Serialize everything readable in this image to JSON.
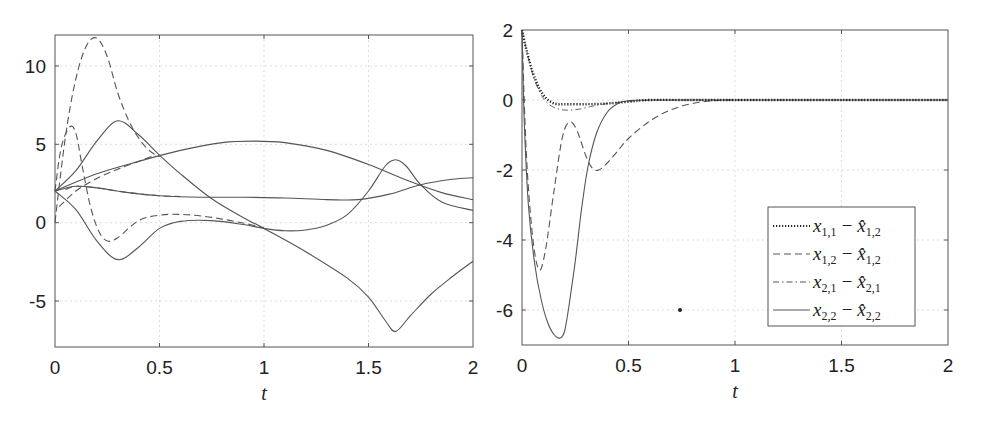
{
  "chart_data": [
    {
      "type": "line",
      "title": "",
      "xlabel": "t",
      "ylabel": "",
      "xlim": [
        0,
        2
      ],
      "ylim": [
        -8,
        12
      ],
      "xticks": [
        "0",
        "0.5",
        "1",
        "1.5",
        "2"
      ],
      "yticks": [
        "-5",
        "0",
        "5",
        "10"
      ],
      "grid": true,
      "legend": null,
      "series": [
        {
          "name": "dashed-large-peak",
          "style": "dashed",
          "x": [
            0,
            0.05,
            0.1,
            0.15,
            0.2,
            0.25,
            0.3,
            0.35,
            0.4,
            0.45,
            0.5
          ],
          "y": [
            0,
            5.5,
            9.2,
            11.3,
            11.8,
            10.6,
            8.3,
            6.6,
            5.4,
            4.6,
            4.2
          ]
        },
        {
          "name": "dashed-small-peak",
          "style": "dashed",
          "x": [
            0,
            0.03,
            0.07,
            0.1,
            0.13,
            0.17,
            0.21,
            0.25,
            0.3,
            0.4,
            0.5,
            0.6,
            0.7,
            0.8,
            0.9,
            1.0
          ],
          "y": [
            2,
            4.8,
            6.1,
            5.7,
            3.6,
            1.0,
            -0.6,
            -1.2,
            -1.0,
            0.1,
            0.45,
            0.5,
            0.4,
            0.2,
            -0.05,
            -0.35
          ]
        },
        {
          "name": "solid-peak-then-descent",
          "style": "solid",
          "x": [
            0,
            0.1,
            0.2,
            0.3,
            0.4,
            0.5,
            0.6,
            0.75,
            0.9,
            1.0,
            1.2,
            1.4,
            1.5,
            1.58,
            1.63,
            1.7,
            1.8,
            1.9,
            2.0
          ],
          "y": [
            2,
            3.3,
            5.2,
            6.5,
            5.6,
            4.3,
            3.1,
            1.5,
            0.3,
            -0.4,
            -1.9,
            -3.6,
            -4.8,
            -6.3,
            -7.0,
            -6.0,
            -4.6,
            -3.5,
            -2.5
          ]
        },
        {
          "name": "solid-arch",
          "style": "solid",
          "x": [
            0,
            0.2,
            0.4,
            0.6,
            0.8,
            0.95,
            1.1,
            1.3,
            1.5,
            1.7,
            1.85,
            2.0
          ],
          "y": [
            2,
            3.1,
            3.9,
            4.6,
            5.1,
            5.2,
            5.1,
            4.6,
            3.7,
            2.6,
            1.9,
            1.45
          ]
        },
        {
          "name": "dashed-along-arch",
          "style": "dashed",
          "x": [
            0.02,
            0.1,
            0.2,
            0.3,
            0.4,
            0.48
          ],
          "y": [
            1.0,
            2.0,
            2.8,
            3.4,
            3.9,
            4.3
          ]
        },
        {
          "name": "solid-flat-then-rise",
          "style": "solid",
          "x": [
            0,
            0.1,
            0.2,
            0.35,
            0.5,
            0.7,
            0.9,
            1.1,
            1.3,
            1.45,
            1.6,
            1.75,
            1.9,
            2.0
          ],
          "y": [
            2,
            2.3,
            2.2,
            1.9,
            1.7,
            1.6,
            1.6,
            1.55,
            1.45,
            1.45,
            1.8,
            2.4,
            2.75,
            2.85
          ]
        },
        {
          "name": "dashed-flat",
          "style": "dashed",
          "x": [
            0.05,
            0.1,
            0.2,
            0.35,
            0.5,
            0.6
          ],
          "y": [
            2.1,
            2.3,
            2.2,
            1.9,
            1.7,
            1.65
          ]
        },
        {
          "name": "solid-dip-then-bump",
          "style": "solid",
          "x": [
            0,
            0.1,
            0.2,
            0.3,
            0.4,
            0.5,
            0.6,
            0.75,
            0.9,
            1.0,
            1.1,
            1.2,
            1.3,
            1.4,
            1.5,
            1.58,
            1.63,
            1.68,
            1.75,
            1.85,
            2.0
          ],
          "y": [
            2,
            0.8,
            -1.2,
            -2.4,
            -1.6,
            -0.4,
            0.05,
            0.1,
            -0.15,
            -0.4,
            -0.55,
            -0.5,
            -0.2,
            0.5,
            2.0,
            3.6,
            4.0,
            3.6,
            2.4,
            1.3,
            0.75
          ]
        }
      ]
    },
    {
      "type": "line",
      "title": "",
      "xlabel": "t",
      "ylabel": "",
      "xlim": [
        0,
        2
      ],
      "ylim": [
        -7,
        2
      ],
      "xticks": [
        "0",
        "0.5",
        "1",
        "1.5",
        "2"
      ],
      "yticks": [
        "2",
        "0",
        "-2",
        "-4",
        "-6"
      ],
      "grid": true,
      "legend": {
        "position": "lower right"
      },
      "annotations": [
        {
          "type": "point",
          "x": 0.74,
          "y": -6
        }
      ],
      "series": [
        {
          "name": "x_{1,1} - x̂_{1,2}",
          "style": "dotted",
          "x": [
            0,
            0.02,
            0.05,
            0.08,
            0.11,
            0.14,
            0.17,
            0.2,
            0.3,
            0.4,
            0.5,
            0.6,
            0.8,
            1.0,
            1.5,
            2.0
          ],
          "y": [
            2,
            1.45,
            0.8,
            0.35,
            0.07,
            -0.07,
            -0.12,
            -0.12,
            -0.12,
            -0.1,
            -0.05,
            0.0,
            0.0,
            0.0,
            0.0,
            0.0
          ]
        },
        {
          "name": "x_{1,2} - x̂_{1,2}",
          "style": "dashed",
          "x": [
            0,
            0.02,
            0.05,
            0.08,
            0.11,
            0.15,
            0.19,
            0.225,
            0.26,
            0.3,
            0.33,
            0.36,
            0.4,
            0.45,
            0.5,
            0.6,
            0.7,
            0.8,
            0.9,
            1.0
          ],
          "y": [
            2,
            -1.5,
            -3.9,
            -4.85,
            -4.3,
            -2.6,
            -1.05,
            -0.63,
            -0.9,
            -1.6,
            -1.95,
            -2.0,
            -1.8,
            -1.45,
            -1.1,
            -0.6,
            -0.28,
            -0.1,
            -0.02,
            0.0
          ]
        },
        {
          "name": "x_{2,1} - x̂_{2,1}",
          "style": "dashdot",
          "x": [
            0,
            0.03,
            0.06,
            0.1,
            0.14,
            0.18,
            0.22,
            0.27,
            0.32,
            0.38,
            0.45,
            0.55,
            0.7,
            1.0,
            2.0
          ],
          "y": [
            2,
            1.2,
            0.55,
            0.05,
            -0.18,
            -0.27,
            -0.29,
            -0.26,
            -0.19,
            -0.12,
            -0.07,
            -0.02,
            0.0,
            0.0,
            0.0
          ]
        },
        {
          "name": "x_{2,2} - x̂_{2,2}",
          "style": "solid",
          "x": [
            0,
            0.01,
            0.03,
            0.06,
            0.09,
            0.12,
            0.15,
            0.18,
            0.2,
            0.22,
            0.25,
            0.28,
            0.31,
            0.35,
            0.4,
            0.45,
            0.5,
            0.6,
            1.0,
            2.0
          ],
          "y": [
            2,
            -0.5,
            -3.0,
            -4.7,
            -5.7,
            -6.35,
            -6.7,
            -6.8,
            -6.6,
            -5.9,
            -4.6,
            -3.1,
            -1.9,
            -0.95,
            -0.35,
            -0.1,
            -0.02,
            0.0,
            0.0,
            0.0
          ]
        }
      ]
    }
  ],
  "left_plot": {
    "xticks": [
      "0",
      "0.5",
      "1",
      "1.5",
      "2"
    ],
    "yticks": [
      "10",
      "5",
      "0",
      "-5"
    ],
    "xlabel": "t"
  },
  "right_plot": {
    "xticks": [
      "0",
      "0.5",
      "1",
      "1.5",
      "2"
    ],
    "yticks": [
      "2",
      "0",
      "-2",
      "-4",
      "-6"
    ],
    "xlabel": "t",
    "legend": [
      {
        "a": "x",
        "a_sub": "1,1",
        "op": "−",
        "b": "x̂",
        "b_sub": "1,2"
      },
      {
        "a": "x",
        "a_sub": "1,2",
        "op": "−",
        "b": "x̂",
        "b_sub": "1,2"
      },
      {
        "a": "x",
        "a_sub": "2,1",
        "op": "−",
        "b": "x̂",
        "b_sub": "2,1"
      },
      {
        "a": "x",
        "a_sub": "2,2",
        "op": "−",
        "b": "x̂",
        "b_sub": "2,2"
      }
    ]
  },
  "colors": {
    "line": "#555555",
    "dotted": "#222222",
    "grid": "#dddddd",
    "axis": "#555555"
  }
}
